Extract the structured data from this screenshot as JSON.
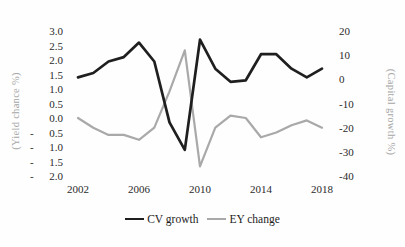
{
  "chart_data": {
    "type": "line",
    "x": [
      2002,
      2003,
      2004,
      2005,
      2006,
      2007,
      2008,
      2009,
      2010,
      2011,
      2012,
      2013,
      2014,
      2015,
      2016,
      2017,
      2018
    ],
    "series": [
      {
        "name": "CV growth",
        "axis": "left",
        "color": "#1f1f1f",
        "stroke_width": 2.7,
        "values": [
          1.4,
          1.55,
          1.95,
          2.1,
          2.6,
          1.95,
          -0.15,
          -1.1,
          2.7,
          1.7,
          1.25,
          1.3,
          2.2,
          2.2,
          1.7,
          1.4,
          1.7
        ]
      },
      {
        "name": "EY change",
        "axis": "right",
        "color": "#a9a9a9",
        "stroke_width": 2.2,
        "values": [
          -16,
          -20,
          -23,
          -23,
          -25,
          -20,
          -5,
          12,
          -36,
          -20,
          -15,
          -16,
          -24,
          -22,
          -19,
          -17,
          -20
        ]
      }
    ],
    "left_axis": {
      "title": "(Yield chance %)",
      "min": -2.0,
      "max": 3.0,
      "ticks": [
        {
          "value": 3.0,
          "text": "3.0",
          "neg": false
        },
        {
          "value": 2.5,
          "text": "2.5",
          "neg": false
        },
        {
          "value": 2.0,
          "text": "2.0",
          "neg": false
        },
        {
          "value": 1.5,
          "text": "1.5",
          "neg": false
        },
        {
          "value": 1.0,
          "text": "1.0",
          "neg": false
        },
        {
          "value": 0.5,
          "text": "0.5",
          "neg": false
        },
        {
          "value": 0.0,
          "text": "0.0",
          "neg": false
        },
        {
          "value": -0.5,
          "text": "0.5",
          "neg": true
        },
        {
          "value": -1.0,
          "text": "1.0",
          "neg": true
        },
        {
          "value": -1.5,
          "text": "1.5",
          "neg": true
        },
        {
          "value": -2.0,
          "text": "2.0",
          "neg": true
        }
      ]
    },
    "right_axis": {
      "title": "(Capital growth %)",
      "min": -40,
      "max": 20,
      "ticks": [
        {
          "value": 20,
          "text": "20"
        },
        {
          "value": 10,
          "text": "10"
        },
        {
          "value": 0,
          "text": "0"
        },
        {
          "value": -10,
          "text": "-10"
        },
        {
          "value": -20,
          "text": "-20"
        },
        {
          "value": -30,
          "text": "-30"
        },
        {
          "value": -40,
          "text": "-40"
        }
      ]
    },
    "x_axis": {
      "ticks": [
        {
          "value": 2002,
          "text": "2002"
        },
        {
          "value": 2006,
          "text": "2006"
        },
        {
          "value": 2010,
          "text": "2010"
        },
        {
          "value": 2014,
          "text": "2014"
        },
        {
          "value": 2018,
          "text": "2018"
        }
      ]
    },
    "legend_position": "bottom",
    "grid": false
  }
}
